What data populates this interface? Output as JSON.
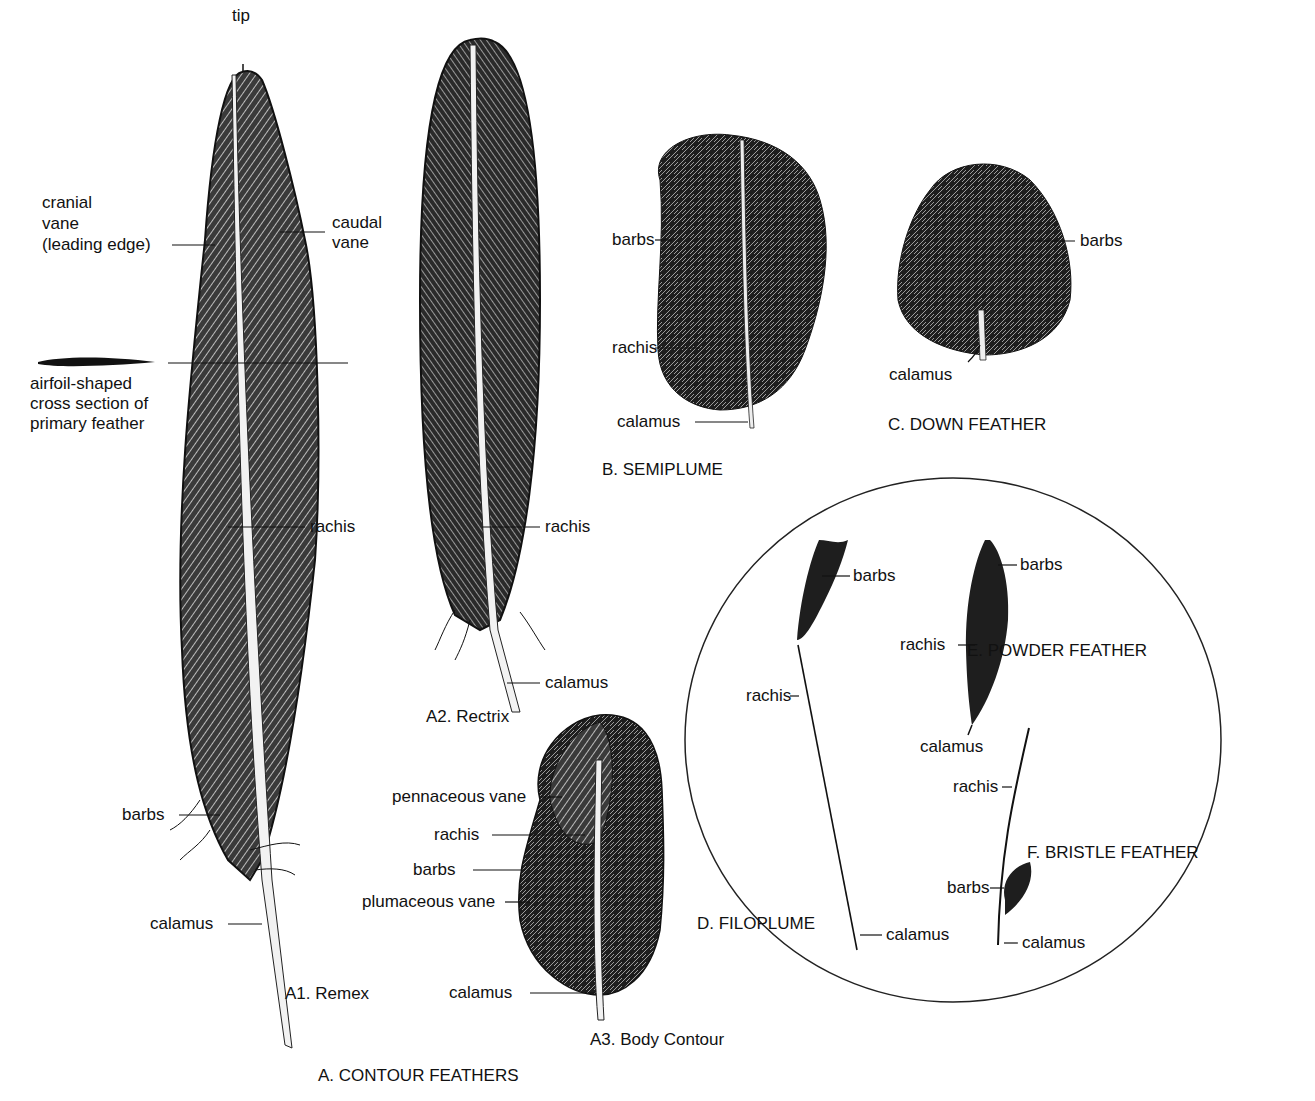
{
  "figure": {
    "groups": {
      "A": "A. CONTOUR FEATHERS",
      "A1": "A1. Remex",
      "A2": "A2. Rectrix",
      "A3": "A3. Body Contour",
      "B": "B. SEMIPLUME",
      "C": "C. DOWN FEATHER",
      "D": "D. FILOPLUME",
      "E": "E. POWDER FEATHER",
      "F": "F. BRISTLE FEATHER"
    },
    "remex": {
      "tip": "tip",
      "cranial_l1": "cranial",
      "cranial_l2": "vane",
      "cranial_l3": "(leading edge)",
      "caudal_l1": "caudal",
      "caudal_l2": "vane",
      "airfoil_l1": "airfoil-shaped",
      "airfoil_l2": "cross section of",
      "airfoil_l3": "primary feather",
      "rachis": "rachis",
      "barbs": "barbs",
      "calamus": "calamus"
    },
    "rectrix": {
      "rachis": "rachis",
      "calamus": "calamus"
    },
    "body_contour": {
      "pennaceous": "pennaceous vane",
      "rachis": "rachis",
      "barbs": "barbs",
      "plumaceous": "plumaceous vane",
      "calamus": "calamus"
    },
    "semiplume": {
      "barbs": "barbs",
      "rachis": "rachis",
      "calamus": "calamus"
    },
    "down": {
      "barbs": "barbs",
      "calamus": "calamus"
    },
    "filoplume": {
      "barbs": "barbs",
      "rachis": "rachis",
      "calamus": "calamus"
    },
    "powder": {
      "barbs": "barbs",
      "rachis": "rachis",
      "calamus": "calamus"
    },
    "bristle": {
      "rachis": "rachis",
      "barbs": "barbs",
      "calamus": "calamus"
    }
  }
}
